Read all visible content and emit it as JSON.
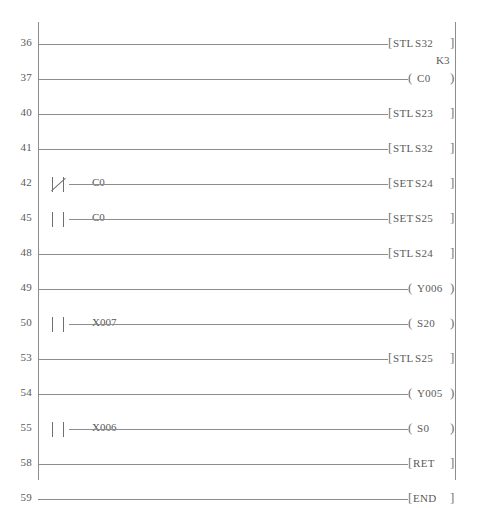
{
  "diagram": {
    "type": "ladder-logic",
    "line_color": "#8d8d8d",
    "text_color": "#5a5a5a",
    "background": "#ffffff",
    "rungs": [
      {
        "number": "36",
        "contact": null,
        "element_kind": "instruction",
        "mnemonic": "STL",
        "operand": "S32",
        "preset": null
      },
      {
        "number": "37",
        "contact": null,
        "element_kind": "coil",
        "mnemonic": "",
        "operand": "C0",
        "preset": "K3"
      },
      {
        "number": "40",
        "contact": null,
        "element_kind": "instruction",
        "mnemonic": "STL",
        "operand": "S23",
        "preset": null
      },
      {
        "number": "41",
        "contact": null,
        "element_kind": "instruction",
        "mnemonic": "STL",
        "operand": "S32",
        "preset": null
      },
      {
        "number": "42",
        "contact": {
          "label": "C0",
          "type": "normally-closed"
        },
        "element_kind": "instruction",
        "mnemonic": "SET",
        "operand": "S24",
        "preset": null
      },
      {
        "number": "45",
        "contact": {
          "label": "C0",
          "type": "normally-open"
        },
        "element_kind": "instruction",
        "mnemonic": "SET",
        "operand": "S25",
        "preset": null
      },
      {
        "number": "48",
        "contact": null,
        "element_kind": "instruction",
        "mnemonic": "STL",
        "operand": "S24",
        "preset": null
      },
      {
        "number": "49",
        "contact": null,
        "element_kind": "coil",
        "mnemonic": "",
        "operand": "Y006",
        "preset": null
      },
      {
        "number": "50",
        "contact": {
          "label": "X007",
          "type": "normally-open"
        },
        "element_kind": "coil",
        "mnemonic": "",
        "operand": "S20",
        "preset": null
      },
      {
        "number": "53",
        "contact": null,
        "element_kind": "instruction",
        "mnemonic": "STL",
        "operand": "S25",
        "preset": null
      },
      {
        "number": "54",
        "contact": null,
        "element_kind": "coil",
        "mnemonic": "",
        "operand": "Y005",
        "preset": null
      },
      {
        "number": "55",
        "contact": {
          "label": "X006",
          "type": "normally-open"
        },
        "element_kind": "coil",
        "mnemonic": "",
        "operand": "S0",
        "preset": null
      },
      {
        "number": "58",
        "contact": null,
        "element_kind": "instruction",
        "mnemonic": "RET",
        "operand": "",
        "preset": null
      },
      {
        "number": "59",
        "contact": null,
        "element_kind": "instruction",
        "mnemonic": "END",
        "operand": "",
        "preset": null
      }
    ]
  }
}
